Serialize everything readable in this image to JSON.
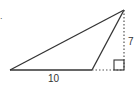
{
  "diagram": {
    "type": "triangle",
    "question_marker": ".",
    "labels": {
      "base": "10",
      "height": "7"
    },
    "points": {
      "A": [
        10,
        70
      ],
      "B": [
        92,
        70
      ],
      "C": [
        124,
        10
      ],
      "foot": [
        124,
        70
      ]
    },
    "right_angle_marker": true,
    "colors": {
      "stroke": "#333333",
      "dotted": "#555555",
      "background": "#ffffff"
    }
  }
}
